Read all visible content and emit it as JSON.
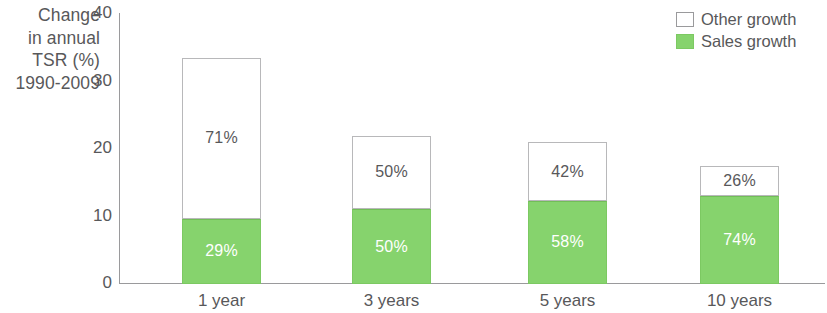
{
  "axis_title": {
    "lines": [
      "Change",
      "in annual",
      "TSR (%)",
      "1990-2009"
    ]
  },
  "legend": {
    "items": [
      {
        "label": "Other growth",
        "swatch": "white-square-icon",
        "color": "#ffffff"
      },
      {
        "label": "Sales growth",
        "swatch": "green-square-icon",
        "color": "#86d36d"
      }
    ]
  },
  "colors": {
    "sales_growth": "#86d36d",
    "other_growth": "#ffffff",
    "axis": "#9a9a9c",
    "text": "#58585a"
  },
  "chart_data": {
    "type": "bar",
    "subtype": "stacked",
    "title": "",
    "xlabel": "",
    "ylabel": "Change in annual TSR (%) 1990-2009",
    "ylim": [
      0,
      40
    ],
    "yticks": [
      0,
      10,
      20,
      30,
      40
    ],
    "ytick_labels": [
      "0",
      "10",
      "20",
      "30",
      "40"
    ],
    "grid": false,
    "legend_position": "top-right",
    "categories": [
      "1 year",
      "3 years",
      "5 years",
      "10 years"
    ],
    "series": [
      {
        "name": "Sales growth",
        "color": "#86d36d",
        "values": [
          9.7,
          11.1,
          12.3,
          13.0
        ],
        "data_labels": [
          "29%",
          "50%",
          "58%",
          "74%"
        ]
      },
      {
        "name": "Other growth",
        "color": "#ffffff",
        "values": [
          23.8,
          10.9,
          8.7,
          4.5
        ],
        "data_labels": [
          "71%",
          "50%",
          "42%",
          "26%"
        ]
      }
    ],
    "totals": [
      33.5,
      22.0,
      21.0,
      17.5
    ]
  }
}
